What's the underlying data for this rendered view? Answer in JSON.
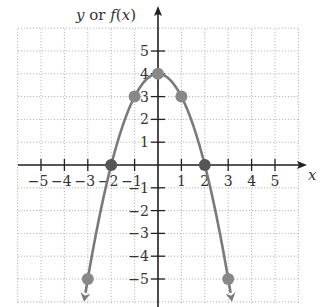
{
  "chart_data": {
    "type": "line",
    "title": "",
    "xlabel": "x",
    "ylabel": "y or f(x)",
    "ylabel_parts": {
      "y": "y",
      "or": " or ",
      "f": "f",
      "open": "(",
      "x": "x",
      "close": ")"
    },
    "function": "f(x) = -x^2 + 4",
    "xlim": [
      -6,
      6
    ],
    "ylim": [
      -6,
      6
    ],
    "grid": true,
    "x_ticks": [
      -5,
      -4,
      -3,
      -2,
      -1,
      1,
      2,
      3,
      4,
      5
    ],
    "x_tick_labels": [
      "−5",
      "−4",
      "−3",
      "−2",
      "−1",
      "1",
      "2",
      "3",
      "4",
      "5"
    ],
    "y_ticks": [
      -5,
      -4,
      -3,
      -2,
      -1,
      1,
      2,
      3,
      4,
      5
    ],
    "y_tick_labels": [
      "−5",
      "−4",
      "−3",
      "−2",
      "−1",
      "1",
      "2",
      "3",
      "4",
      "5"
    ],
    "points": [
      {
        "x": -3,
        "y": -5
      },
      {
        "x": -2,
        "y": 0
      },
      {
        "x": -1,
        "y": 3
      },
      {
        "x": 0,
        "y": 4
      },
      {
        "x": 1,
        "y": 3
      },
      {
        "x": 2,
        "y": 0
      },
      {
        "x": 3,
        "y": -5
      }
    ],
    "series": [
      {
        "name": "f(x)",
        "x": [
          -3,
          -2,
          -1,
          0,
          1,
          2,
          3
        ],
        "values": [
          -5,
          0,
          3,
          4,
          3,
          0,
          -5
        ]
      }
    ],
    "arrows_at_ends": true,
    "colors": {
      "curve": "#7a7a7a",
      "point": "#888888",
      "axis": "#222222",
      "grid": "#b8b8b8"
    }
  }
}
